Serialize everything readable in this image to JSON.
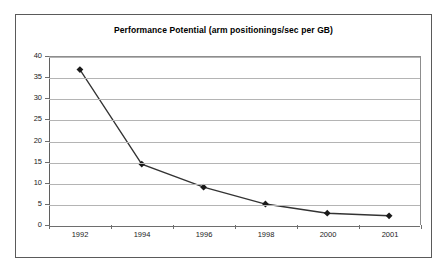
{
  "chart_data": {
    "type": "line",
    "title": "Performance Potential (arm positionings/sec per GB)",
    "xlabel": "",
    "ylabel": "",
    "categories": [
      "1992",
      "1994",
      "1996",
      "1998",
      "2000",
      "2001"
    ],
    "values": [
      37,
      14.5,
      9,
      5,
      2.8,
      2.2
    ],
    "series": [
      {
        "name": "Performance Potential",
        "values": [
          37,
          14.5,
          9,
          5,
          2.8,
          2.2
        ],
        "marker": "diamond",
        "line_color": "#333333",
        "marker_color": "#1a1a1a"
      }
    ],
    "ylim": [
      0,
      40
    ],
    "ytick_step": 5,
    "yticks": [
      "40",
      "35",
      "30",
      "25",
      "20",
      "15",
      "10",
      "5",
      "0"
    ],
    "grid": "horizontal",
    "legend": "none",
    "plot_background": "#ffffff",
    "gridline_color": "#b4b4b4",
    "frame_color": "#5a5a5a"
  }
}
